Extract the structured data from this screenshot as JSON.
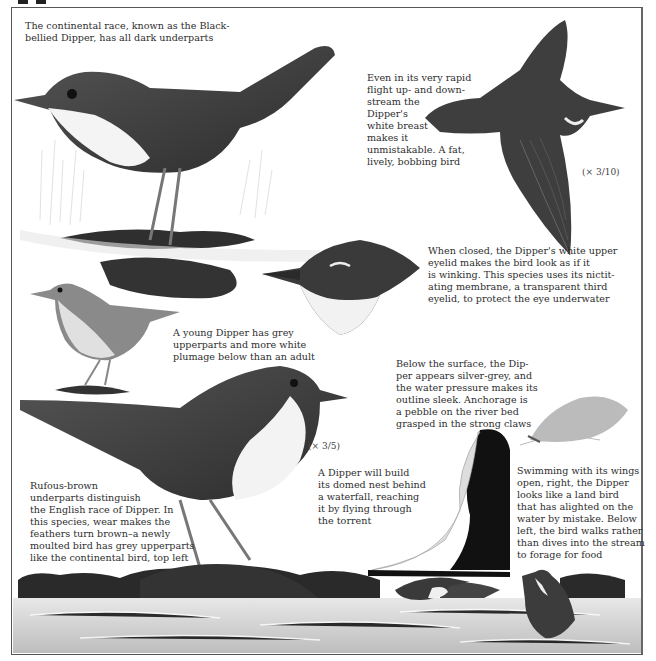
{
  "page": {
    "subject": "Dipper",
    "captions": {
      "continental": "The continental race, known as the Black-bellied Dipper, has all dark underparts",
      "flight": "Even in its very rapid flight up- and down-stream the Dipper's white breast makes it unmistakable. A fat, lively, bobbing bird",
      "eyelid": "When closed, the Dipper's white upper eyelid makes the bird look as if it is winking. This species uses its nictitating membrane, a transparent third eyelid, to protect the eye underwater",
      "young": "A young Dipper has grey upperparts and more white plumage below than an adult",
      "underwater": "Below the surface, the Dipper appears silver-grey, and the water pressure makes its outline sleek. Anchorage is a pebble on the river bed grasped in the strong claws",
      "english_race": "Rufous-brown underparts distinguish the English race of Dipper. In this species, wear makes the feathers turn brown–a newly moulted bird has grey upperparts like the continental bird, top left",
      "nest": "A Dipper will build its domed nest behind a waterfall, reaching it by flying through the torrent",
      "swimming": "Swimming with its wings open, right, the Dipper looks like a land bird that has alighted on the water by mistake. Below left, the bird walks rather than dives into the stream to forage for food"
    },
    "caption_lines": {
      "continental": [
        "The continental race, known as the Black-",
        "bellied Dipper, has all dark underparts"
      ],
      "flight": [
        "Even in its very rapid",
        "flight up- and down-",
        "stream the",
        "Dipper's",
        "white breast",
        "makes it",
        "unmistakable. A fat,",
        "lively, bobbing bird"
      ],
      "eyelid": [
        "When closed, the Dipper's white upper",
        "eyelid makes the bird look as if it",
        "is winking. This species uses its nictit-",
        "ating membrane, a transparent third",
        "eyelid, to protect the eye underwater"
      ],
      "young": [
        "A young Dipper has grey",
        "upperparts and more white",
        "plumage below than an adult"
      ],
      "underwater": [
        "Below the surface, the Dip-",
        "per appears silver-grey, and",
        "the water pressure makes its",
        "outline sleek. Anchorage is",
        "a pebble on the river bed",
        "grasped in the strong claws"
      ],
      "english_race": [
        "Rufous-brown",
        "underparts distinguish",
        "the English race of Dipper. In",
        "this species, wear makes the",
        "feathers turn brown–a newly",
        "moulted bird has grey upperparts",
        "like the continental bird, top left"
      ],
      "nest": [
        "A Dipper will build",
        "its domed nest behind",
        "a waterfall, reaching",
        "it by flying through",
        "the torrent"
      ],
      "swimming": [
        "Swimming with its wings",
        "open, right, the Dipper",
        "looks like a land bird",
        "that has alighted on the",
        "water by mistake. Below",
        "left, the bird walks rather",
        "than dives into the stream",
        "to forage for food"
      ]
    },
    "scale_labels": {
      "flight": "(× 3/10)",
      "main": "(× 3/5)"
    },
    "illustrations": [
      "black-bellied-dipper-on-rock",
      "dipper-in-flight",
      "dipper-head-winking",
      "young-dipper",
      "english-dipper-on-rock",
      "dipper-underwater",
      "dipper-waterfall-nest",
      "dipper-swimming",
      "dipper-walking-in-stream"
    ],
    "colors": {
      "ink": "#2e2e2e",
      "frame": "#555555",
      "bird_dark": "#3a3a3a",
      "bird_mid": "#6a6a6a",
      "water": "#c8c8c8"
    }
  }
}
